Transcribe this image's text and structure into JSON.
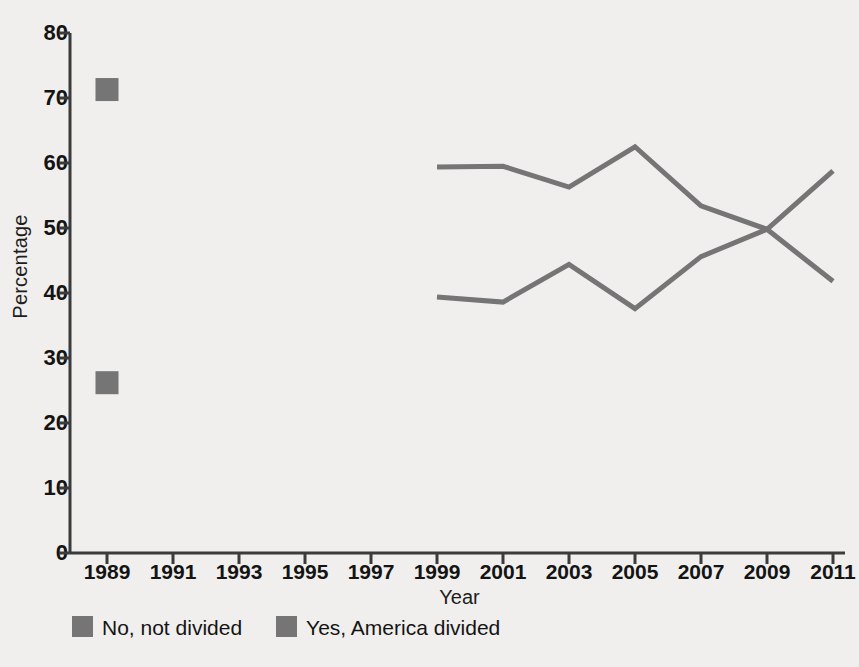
{
  "chart_data": {
    "type": "line",
    "title": "",
    "xlabel": "Year",
    "ylabel": "Percentage",
    "xlim": [
      1988,
      2012
    ],
    "ylim": [
      0,
      80
    ],
    "grid": false,
    "legend_position": "bottom-left",
    "xticks": [
      "1989",
      "1991",
      "1993",
      "1995",
      "1997",
      "1999",
      "2001",
      "2003",
      "2005",
      "2007",
      "2009",
      "2011"
    ],
    "xtick_values": [
      1989,
      1991,
      1993,
      1995,
      1997,
      1999,
      2001,
      2003,
      2005,
      2007,
      2009,
      2011
    ],
    "yticks": [
      "0",
      "10",
      "20",
      "30",
      "40",
      "50",
      "60",
      "70",
      "80"
    ],
    "ytick_values": [
      0,
      10,
      20,
      30,
      40,
      50,
      60,
      70,
      80
    ],
    "series": [
      {
        "name": "Yes, America divided",
        "color": "#757575",
        "style": "line-with-isolated-marker",
        "x": [
          1989,
          1999,
          2001,
          2003,
          2005,
          2007,
          2009,
          2011
        ],
        "values": [
          26.2,
          39.4,
          38.6,
          44.4,
          37.6,
          45.6,
          49.8,
          58.8
        ]
      },
      {
        "name": "No, not divided",
        "color": "#757575",
        "style": "line-with-isolated-marker",
        "x": [
          1989,
          1999,
          2001,
          2003,
          2005,
          2007,
          2009,
          2011
        ],
        "values": [
          71.3,
          59.4,
          59.5,
          56.3,
          62.5,
          53.4,
          49.8,
          41.8
        ]
      }
    ],
    "marker_points": [
      {
        "year": 1989,
        "value": 71.3,
        "series": "No, not divided"
      },
      {
        "year": 1989,
        "value": 26.2,
        "series": "Yes, America divided"
      }
    ]
  },
  "legend": {
    "items": [
      {
        "label": "No, not divided",
        "color": "#757575"
      },
      {
        "label": "Yes, America divided",
        "color": "#757575"
      }
    ]
  },
  "axes": {
    "y_title": "Percentage",
    "x_title": "Year"
  },
  "colors": {
    "background": "#f0efed",
    "line": "#757575",
    "axis": "#3b3b3b",
    "text": "#141414"
  }
}
